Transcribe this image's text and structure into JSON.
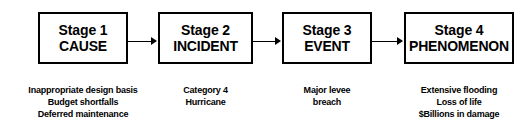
{
  "diagram": {
    "type": "linear-flow-chart",
    "stages": [
      {
        "number_label": "Stage 1",
        "name_label": "CAUSE",
        "captions": [
          "Inappropriate design basis",
          "Budget shortfalls",
          "Deferred maintenance"
        ]
      },
      {
        "number_label": "Stage 2",
        "name_label": "INCIDENT",
        "captions": [
          "Category 4",
          "Hurricane"
        ]
      },
      {
        "number_label": "Stage 3",
        "name_label": "EVENT",
        "captions": [
          "Major levee",
          "breach"
        ]
      },
      {
        "number_label": "Stage 4",
        "name_label": "PHENOMENON",
        "captions": [
          "Extensive flooding",
          "Loss of life",
          "$Billions in damage"
        ]
      }
    ],
    "connectors": [
      {
        "icon": "arrow-right-icon",
        "from": "Stage 1",
        "to": "Stage 2"
      },
      {
        "icon": "arrow-right-icon",
        "from": "Stage 2",
        "to": "Stage 3"
      },
      {
        "icon": "arrow-right-icon",
        "from": "Stage 3",
        "to": "Stage 4"
      }
    ],
    "colors": {
      "background": "#ffffff",
      "border": "#000000",
      "text": "#000000",
      "arrow": "#000000"
    }
  }
}
